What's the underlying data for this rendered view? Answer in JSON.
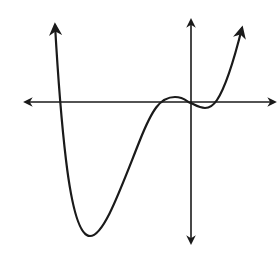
{
  "figure": {
    "background": "#ffffff",
    "stroke_color": "#1a1a1a"
  },
  "axes": {
    "x_axis": {
      "y": 102,
      "x_start": 25,
      "x_end": 275,
      "arrows": "both"
    },
    "y_axis": {
      "x": 191,
      "y_start": 20,
      "y_end": 243,
      "arrows": "both"
    }
  },
  "curve": {
    "type": "polynomial",
    "end_behavior": "both ends rise (arrows up)",
    "x_intercepts_px": [
      60,
      160,
      191,
      215
    ],
    "local_min_px": [
      [
        90,
        236
      ],
      [
        205,
        108
      ]
    ],
    "local_max_px": [
      [
        175,
        97
      ]
    ],
    "path": "M55,25 C57,60 60,110 66,160 C72,210 80,236 90,236 C104,236 120,190 140,140 C152,110 160,97 175,97 C185,97 188,103 191,103 C197,106 200,108 205,108 C210,108 213,106 217,100 C225,88 234,60 242,28"
  }
}
